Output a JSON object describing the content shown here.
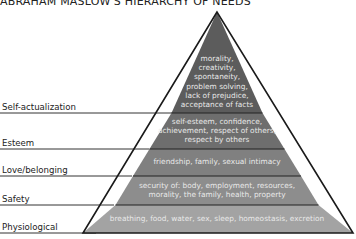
{
  "title": "ABRAHAM MASLOW'S HIERARCHY OF NEEDS",
  "levels": [
    {
      "label": "Self-actualization",
      "lines": [
        "morality,",
        "creativity,",
        "spontaneity,",
        "problem solving,",
        "lack of prejudice,",
        "acceptance of facts"
      ],
      "color": "#5c5c5c"
    },
    {
      "label": "Esteem",
      "lines": [
        "self-esteem, confidence,",
        "achievement, respect of others,",
        "respect by others"
      ],
      "color": "#6e6e6e"
    },
    {
      "label": "Love/belonging",
      "lines": [
        "friendship, family, sexual intimacy"
      ],
      "color": "#808080"
    },
    {
      "label": "Safety",
      "lines": [
        "security of: body, employment, resources,",
        "morality, the family, health, property"
      ],
      "color": "#8d8d8d"
    },
    {
      "label": "Physiological",
      "lines": [
        "breathing, food, water, sex, sleep, homeostasis, excretion"
      ],
      "color": "#a3a3a3"
    }
  ]
}
